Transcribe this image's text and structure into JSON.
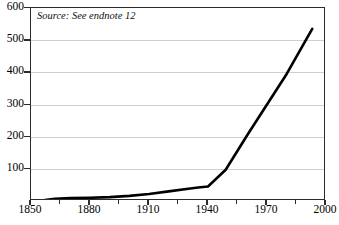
{
  "annotation": {
    "source_note": "Source: See endnote 12"
  },
  "colors": {
    "line": "#000000",
    "grid": "#cfcfcf",
    "axis": "#2b2b2b",
    "background": "#ffffff"
  },
  "chart_data": {
    "type": "line",
    "title": "",
    "subtitle": "",
    "xlabel": "",
    "ylabel": "",
    "xlim": [
      1850,
      2000
    ],
    "ylim": [
      0,
      600
    ],
    "grid": true,
    "legend": "none",
    "annotations": [
      "Source: See endnote 12"
    ],
    "x_tick_labels": [
      "1850",
      "1880",
      "1910",
      "1940",
      "1970",
      "2000"
    ],
    "x_ticks": [
      1850,
      1880,
      1910,
      1940,
      1970,
      2000
    ],
    "x_minor_ticks": [
      1865,
      1895,
      1925,
      1955,
      1985
    ],
    "y_tick_labels": [
      "0",
      "100",
      "200",
      "300",
      "400",
      "500",
      "600"
    ],
    "y_ticks": [
      0,
      100,
      200,
      300,
      400,
      500,
      600
    ],
    "series": [
      {
        "name": "value",
        "x": [
          1856,
          1862,
          1870,
          1880,
          1890,
          1900,
          1910,
          1920,
          1930,
          1935,
          1940,
          1949,
          1960,
          1970,
          1980,
          1993
        ],
        "values": [
          2,
          7,
          9,
          10,
          12,
          16,
          22,
          30,
          38,
          42,
          45,
          97,
          205,
          300,
          395,
          535
        ]
      }
    ]
  }
}
